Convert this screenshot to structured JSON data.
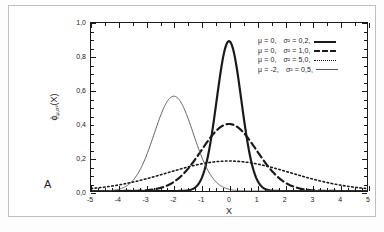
{
  "figure": {
    "panel_label": "A"
  },
  "axes": {
    "x_title": "X",
    "y_title_main": "ϕ",
    "y_title_sub": "μ,σ²",
    "y_title_tail": "(X)",
    "x_ticks": [
      "-5",
      "-4",
      "-3",
      "-2",
      "-1",
      "0",
      "1",
      "2",
      "3",
      "4",
      "5"
    ],
    "y_ticks": [
      "0,0",
      "0,2",
      "0,4",
      "0,6",
      "0,8",
      "1,0"
    ]
  },
  "legend": {
    "entries": [
      {
        "mu": "μ = 0,",
        "sigma": "σ² = 0,2,",
        "style": "solid-thick"
      },
      {
        "mu": "μ = 0,",
        "sigma": "σ² = 1,0,",
        "style": "dashed"
      },
      {
        "mu": "μ = 0,",
        "sigma": "σ² = 5,0,",
        "style": "dotted"
      },
      {
        "mu": "μ = -2,",
        "sigma": "σ² = 0,5,",
        "style": "solid-thin"
      }
    ]
  },
  "colors": {
    "curve_dark": "#1a1a1a",
    "curve_gray": "#5a5a5a",
    "frame": "#1a1a1a",
    "outer_frame": "#bfbfbf",
    "background": "#ffffff"
  },
  "chart_data": {
    "type": "line",
    "title": "",
    "xlabel": "X",
    "ylabel": "ϕ_μ,σ²(X)",
    "xlim": [
      -5,
      5
    ],
    "ylim": [
      0.0,
      1.0
    ],
    "xticks": [
      -5,
      -4,
      -3,
      -2,
      -1,
      0,
      1,
      2,
      3,
      4,
      5
    ],
    "yticks": [
      0.0,
      0.2,
      0.4,
      0.6,
      0.8,
      1.0
    ],
    "grid": false,
    "legend_position": "upper right",
    "x": [
      -5.0,
      -4.5,
      -4.0,
      -3.5,
      -3.0,
      -2.5,
      -2.0,
      -1.5,
      -1.0,
      -0.5,
      0.0,
      0.5,
      1.0,
      1.5,
      2.0,
      2.5,
      3.0,
      3.5,
      4.0,
      4.5,
      5.0
    ],
    "series": [
      {
        "name": "μ = 0, σ² = 0,2",
        "mu": 0,
        "variance": 0.2,
        "peak": 0.892,
        "linestyle": "solid",
        "linewidth": 2.2,
        "color": "#1a1a1a",
        "values": [
          0.0,
          0.0,
          0.0,
          0.0,
          0.0,
          0.0,
          0.0,
          0.003,
          0.087,
          0.646,
          0.892,
          0.646,
          0.087,
          0.003,
          0.0,
          0.0,
          0.0,
          0.0,
          0.0,
          0.0,
          0.0
        ]
      },
      {
        "name": "μ = 0, σ² = 1,0",
        "mu": 0,
        "variance": 1.0,
        "peak": 0.399,
        "linestyle": "dashed",
        "linewidth": 2.2,
        "color": "#1a1a1a",
        "values": [
          0.0,
          0.0,
          0.0,
          0.001,
          0.004,
          0.018,
          0.054,
          0.13,
          0.242,
          0.352,
          0.399,
          0.352,
          0.242,
          0.13,
          0.054,
          0.018,
          0.004,
          0.001,
          0.0,
          0.0,
          0.0
        ]
      },
      {
        "name": "μ = 0, σ² = 5,0",
        "mu": 0,
        "variance": 5.0,
        "peak": 0.178,
        "linestyle": "dotted",
        "linewidth": 1.6,
        "color": "#1a1a1a",
        "values": [
          0.015,
          0.024,
          0.036,
          0.051,
          0.07,
          0.09,
          0.109,
          0.128,
          0.145,
          0.158,
          0.168,
          0.158,
          0.145,
          0.128,
          0.109,
          0.09,
          0.07,
          0.051,
          0.036,
          0.024,
          0.015
        ]
      },
      {
        "name": "μ = -2, σ² = 0,5",
        "mu": -2,
        "variance": 0.5,
        "peak": 0.564,
        "linestyle": "solid",
        "linewidth": 1.0,
        "color": "#5a5a5a",
        "values": [
          0.005,
          0.026,
          0.104,
          0.26,
          0.439,
          0.52,
          0.564,
          0.52,
          0.439,
          0.26,
          0.104,
          0.026,
          0.005,
          0.0,
          0.0,
          0.0,
          0.0,
          0.0,
          0.0,
          0.0,
          0.0
        ]
      }
    ]
  }
}
